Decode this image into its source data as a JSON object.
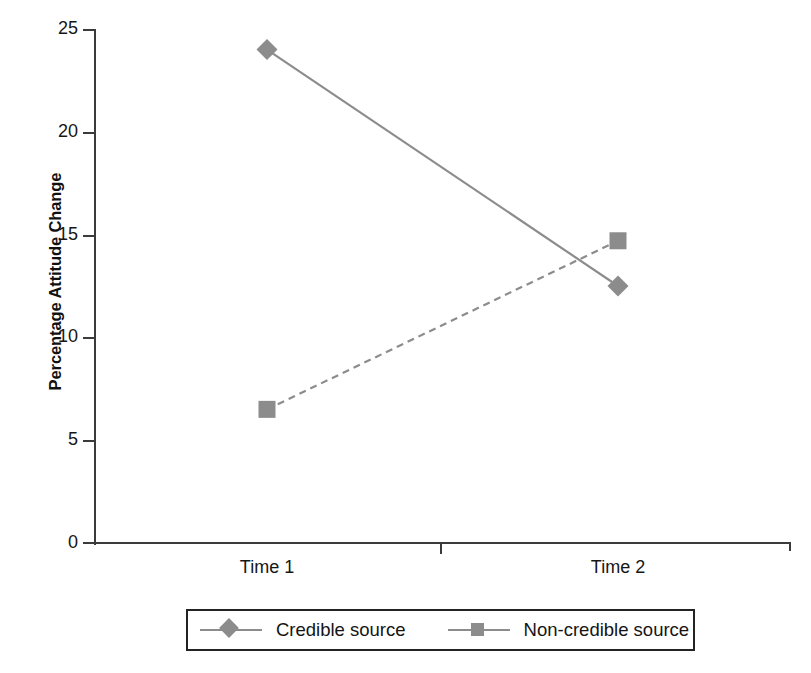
{
  "chart_data": {
    "type": "line",
    "title": "",
    "xlabel": "",
    "ylabel": "Percentage Attitude Change",
    "categories": [
      "Time 1",
      "Time 2"
    ],
    "series": [
      {
        "name": "Credible source",
        "values": [
          24.0,
          12.5
        ],
        "marker": "diamond",
        "linestyle": "solid",
        "color": "#8c8c8c"
      },
      {
        "name": "Non-credible source",
        "values": [
          6.5,
          14.7
        ],
        "marker": "square",
        "linestyle": "dashed",
        "color": "#8c8c8c"
      }
    ],
    "ylim": [
      0,
      25
    ],
    "yticks": [
      0,
      5,
      10,
      15,
      20,
      25
    ],
    "ytick_labels": [
      "0",
      "5",
      "10",
      "15",
      "20",
      "25"
    ],
    "grid": false,
    "legend_position": "bottom"
  },
  "axes": {
    "y_title": "Percentage Attitude Change",
    "y_tick_labels": [
      "25",
      "20",
      "15",
      "10",
      "5",
      "0"
    ],
    "x_tick_labels": [
      "Time 1",
      "Time 2"
    ]
  },
  "legend": {
    "items": [
      {
        "label": "Credible source",
        "marker": "diamond-marker",
        "color": "#8c8c8c"
      },
      {
        "label": "Non-credible source",
        "marker": "square-marker",
        "color": "#8c8c8c"
      }
    ]
  }
}
